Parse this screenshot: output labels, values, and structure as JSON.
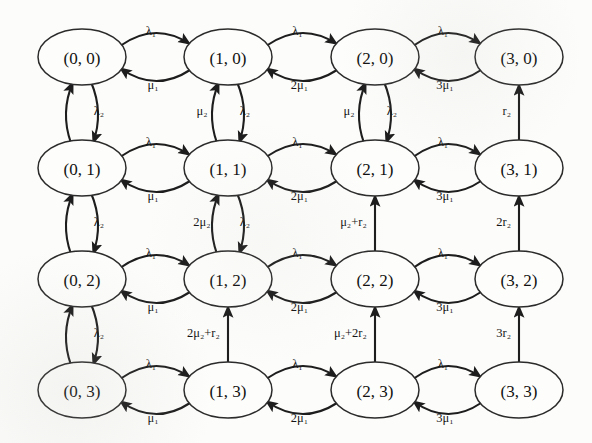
{
  "figure": {
    "kind": "state-transition-diagram",
    "title": "",
    "background_color": "#fcfcfa",
    "node_stroke_color": "#2b2b2b",
    "edge_stroke_color": "#1d1d1d",
    "grid_rows": 4,
    "grid_cols": 4
  },
  "nodes": [
    {
      "id": "n00",
      "label": "(0, 0)",
      "col": 0,
      "row": 0,
      "cx": 82,
      "cy": 57
    },
    {
      "id": "n10",
      "label": "(1, 0)",
      "col": 1,
      "row": 0,
      "cx": 228,
      "cy": 57
    },
    {
      "id": "n20",
      "label": "(2, 0)",
      "col": 2,
      "row": 0,
      "cx": 375,
      "cy": 57
    },
    {
      "id": "n30",
      "label": "(3, 0)",
      "col": 3,
      "row": 0,
      "cx": 519,
      "cy": 57
    },
    {
      "id": "n01",
      "label": "(0, 1)",
      "col": 0,
      "row": 1,
      "cx": 82,
      "cy": 168
    },
    {
      "id": "n11",
      "label": "(1, 1)",
      "col": 1,
      "row": 1,
      "cx": 228,
      "cy": 168
    },
    {
      "id": "n21",
      "label": "(2, 1)",
      "col": 2,
      "row": 1,
      "cx": 375,
      "cy": 168
    },
    {
      "id": "n31",
      "label": "(3, 1)",
      "col": 3,
      "row": 1,
      "cx": 519,
      "cy": 168
    },
    {
      "id": "n02",
      "label": "(0, 2)",
      "col": 0,
      "row": 2,
      "cx": 82,
      "cy": 279
    },
    {
      "id": "n12",
      "label": "(1, 2)",
      "col": 1,
      "row": 2,
      "cx": 228,
      "cy": 279
    },
    {
      "id": "n22",
      "label": "(2, 2)",
      "col": 2,
      "row": 2,
      "cx": 375,
      "cy": 279
    },
    {
      "id": "n32",
      "label": "(3, 2)",
      "col": 3,
      "row": 2,
      "cx": 519,
      "cy": 279
    },
    {
      "id": "n03",
      "label": "(0, 3)",
      "col": 0,
      "row": 3,
      "cx": 82,
      "cy": 390
    },
    {
      "id": "n13",
      "label": "(1, 3)",
      "col": 1,
      "row": 3,
      "cx": 228,
      "cy": 390
    },
    {
      "id": "n23",
      "label": "(2, 3)",
      "col": 2,
      "row": 3,
      "cx": 375,
      "cy": 390
    },
    {
      "id": "n33",
      "label": "(3, 3)",
      "col": 3,
      "row": 3,
      "cx": 519,
      "cy": 390
    }
  ],
  "node_geometry": {
    "rx": 44,
    "ry": 28
  },
  "horizontal_edges": [
    {
      "row": 0,
      "from": "n00",
      "to": "n10",
      "forward_label": "λ₁",
      "backward_label": "μ₁"
    },
    {
      "row": 0,
      "from": "n10",
      "to": "n20",
      "forward_label": "λ₁",
      "backward_label": "2μ₁"
    },
    {
      "row": 0,
      "from": "n20",
      "to": "n30",
      "forward_label": "λ₁",
      "backward_label": "3μ₁"
    },
    {
      "row": 1,
      "from": "n01",
      "to": "n11",
      "forward_label": "λ₁",
      "backward_label": "μ₁"
    },
    {
      "row": 1,
      "from": "n11",
      "to": "n21",
      "forward_label": "λ₁",
      "backward_label": "2μ₁"
    },
    {
      "row": 1,
      "from": "n21",
      "to": "n31",
      "forward_label": "λ₁",
      "backward_label": "3μ₁"
    },
    {
      "row": 2,
      "from": "n02",
      "to": "n12",
      "forward_label": "λ₁",
      "backward_label": "μ₁"
    },
    {
      "row": 2,
      "from": "n12",
      "to": "n22",
      "forward_label": "λ₁",
      "backward_label": "2μ₁"
    },
    {
      "row": 2,
      "from": "n22",
      "to": "n32",
      "forward_label": "λ₁",
      "backward_label": "3μ₁"
    },
    {
      "row": 3,
      "from": "n03",
      "to": "n13",
      "forward_label": "λ₁",
      "backward_label": "μ₁"
    },
    {
      "row": 3,
      "from": "n13",
      "to": "n23",
      "forward_label": "λ₁",
      "backward_label": "2μ₁"
    },
    {
      "row": 3,
      "from": "n23",
      "to": "n33",
      "forward_label": "λ₁",
      "backward_label": "3μ₁"
    }
  ],
  "vertical_edges": [
    {
      "col": 0,
      "from": "n00",
      "to": "n01",
      "style": "curved-pair",
      "down_label": "λ₂",
      "up_label": ""
    },
    {
      "col": 0,
      "from": "n01",
      "to": "n02",
      "style": "curved-pair",
      "down_label": "λ₂",
      "up_label": ""
    },
    {
      "col": 0,
      "from": "n02",
      "to": "n03",
      "style": "curved-pair",
      "down_label": "λ₂",
      "up_label": ""
    },
    {
      "col": 1,
      "from": "n10",
      "to": "n11",
      "style": "curved-pair",
      "down_label": "λ₂",
      "up_label": "μ₂"
    },
    {
      "col": 1,
      "from": "n11",
      "to": "n12",
      "style": "curved-pair",
      "down_label": "λ₂",
      "up_label": "2μ₂"
    },
    {
      "col": 1,
      "from": "n12",
      "to": "n13",
      "style": "straight-up",
      "down_label": "",
      "up_label": "2μ₂+r₂"
    },
    {
      "col": 2,
      "from": "n20",
      "to": "n21",
      "style": "curved-pair",
      "down_label": "λ₂",
      "up_label": "μ₂"
    },
    {
      "col": 2,
      "from": "n21",
      "to": "n22",
      "style": "straight-up",
      "down_label": "",
      "up_label": "μ₂+r₂"
    },
    {
      "col": 2,
      "from": "n22",
      "to": "n23",
      "style": "straight-up",
      "down_label": "",
      "up_label": "μ₂+2r₂"
    },
    {
      "col": 3,
      "from": "n30",
      "to": "n31",
      "style": "straight-up",
      "down_label": "",
      "up_label": "r₂"
    },
    {
      "col": 3,
      "from": "n31",
      "to": "n32",
      "style": "straight-up",
      "down_label": "",
      "up_label": "2r₂"
    },
    {
      "col": 3,
      "from": "n32",
      "to": "n33",
      "style": "straight-up",
      "down_label": "",
      "up_label": "3r₂"
    }
  ],
  "symbols": {
    "arrival_rate_1": "λ₁",
    "arrival_rate_2": "λ₂",
    "service_rate_1": "μ₁",
    "service_rate_2": "μ₂",
    "repair_rate_2": "r₂"
  }
}
